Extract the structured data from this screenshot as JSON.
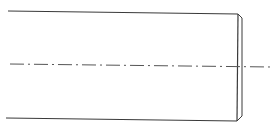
{
  "drawing": {
    "type": "shaft-end-view",
    "stroke_color": "#3a3a3a",
    "centerline_color": "#555555",
    "outline": {
      "top_edge": {
        "x1": 8,
        "y1": 11,
        "x2": 238,
        "y2": 14
      },
      "bottom_edge": {
        "x1": 6,
        "y1": 118,
        "x2": 237,
        "y2": 121
      },
      "end_face": {
        "x1": 238,
        "y1": 14,
        "x2": 237,
        "y2": 121
      },
      "chamfer_top": {
        "x1": 238,
        "y1": 14,
        "x2": 242,
        "y2": 18
      },
      "chamfer_bottom": {
        "x1": 237,
        "y1": 121,
        "x2": 242,
        "y2": 116
      },
      "chamfer_face": {
        "x1": 242,
        "y1": 18,
        "x2": 242,
        "y2": 116
      }
    },
    "centerline": {
      "x1": 10,
      "y1": 64,
      "x2": 272,
      "y2": 67,
      "dash": "14 4 2 4"
    }
  }
}
